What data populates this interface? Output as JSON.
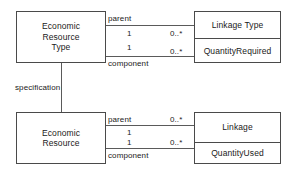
{
  "diagram": {
    "type": "uml-class-diagram",
    "background_color": "#ffffff",
    "line_color": "#4a4a4a",
    "text_color": "#1a1a1a",
    "classes": [
      {
        "id": "economic-resource-type",
        "name": "Economic\nResource\nType",
        "attributes": []
      },
      {
        "id": "linkage-type",
        "name": "Linkage Type",
        "attributes": [
          "QuantityRequired"
        ]
      },
      {
        "id": "economic-resource",
        "name": "Economic\nResource",
        "attributes": []
      },
      {
        "id": "linkage",
        "name": "Linkage",
        "attributes": [
          "QuantityUsed"
        ]
      }
    ],
    "associations": [
      {
        "id": "type-parent",
        "role": "parent",
        "source_multiplicity": "1",
        "target_multiplicity": "0..*"
      },
      {
        "id": "type-component",
        "role": "component",
        "source_multiplicity": "1",
        "target_multiplicity": "0..*"
      },
      {
        "id": "instance-parent",
        "role": "parent",
        "source_multiplicity": "1",
        "target_multiplicity": "0..*"
      },
      {
        "id": "instance-component",
        "role": "component",
        "source_multiplicity": "1",
        "target_multiplicity": "0..*"
      },
      {
        "id": "specification",
        "role": "specification",
        "source_multiplicity": "",
        "target_multiplicity": ""
      }
    ]
  }
}
